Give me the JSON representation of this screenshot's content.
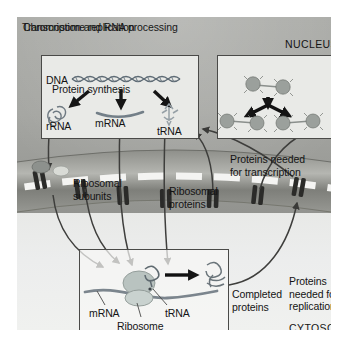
{
  "figure": {
    "type": "cell-biology-diagram"
  },
  "compartments": {
    "nucleus_label": "NUCLEUS",
    "cytosol_label": "CYTOSOL"
  },
  "panels": {
    "transcription": {
      "title": "Transcription and RNA processing",
      "dna_label": "DNA",
      "products": [
        {
          "label": "rRNA"
        },
        {
          "label": "mRNA"
        },
        {
          "label": "tRNA"
        }
      ]
    },
    "replication": {
      "title": "Chromosome replication"
    },
    "synthesis": {
      "title": "Protein synthesis",
      "mrna_label": "mRNA",
      "ribosome_label": "Ribosome",
      "trna_label": "tRNA"
    }
  },
  "flow_labels": {
    "ribosomal_subunits": "Ribosomal subunits",
    "ribosomal_proteins": "Ribosomal proteins",
    "proteins_for_transcription": "Proteins needed for transcription",
    "proteins_for_replication": "Proteins needed for replication",
    "completed_proteins": "Completed proteins"
  },
  "colors": {
    "nucleoplasm": "#a4a5a1",
    "cytosol": "#eceded",
    "panel_fill": "#e9eae7",
    "panel_border": "#4a4a48",
    "arrow": "#3a3a38",
    "envelope": "#9d9e99",
    "pore": "#2e2e2c",
    "mrna": "#7f8a93",
    "ribosome": "#b9c3c0"
  }
}
